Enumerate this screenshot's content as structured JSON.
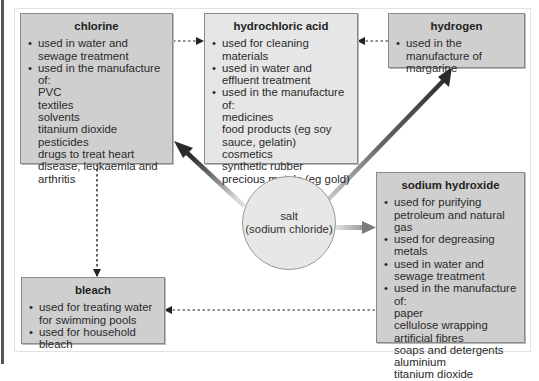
{
  "diagram": {
    "center": {
      "label": "salt",
      "sublabel": "(sodium chloride)"
    },
    "boxes": {
      "chlorine": {
        "title": "chlorine",
        "bullets": [
          {
            "text": "used in water and sewage treatment",
            "items": []
          },
          {
            "text": "used in the manufacture of:",
            "items": [
              "PVC",
              "textiles",
              "solvents",
              "titanium dioxide",
              "pesticides",
              "drugs to treat heart disease, leukaemia and arthritis"
            ]
          }
        ]
      },
      "hydrochloric_acid": {
        "title": "hydrochloric acid",
        "bullets": [
          {
            "text": "used for cleaning materials",
            "items": []
          },
          {
            "text": "used in water and effluent treatment",
            "items": []
          },
          {
            "text": "used in the manufacture of:",
            "items": [
              "medicines",
              "food products (eg soy sauce, gelatin)",
              "cosmetics",
              "synthetic rubber",
              "precious metals (eg gold)"
            ]
          }
        ]
      },
      "hydrogen": {
        "title": "hydrogen",
        "bullets": [
          {
            "text": "used in the manufacture of margarine",
            "items": []
          }
        ]
      },
      "sodium_hydroxide": {
        "title": "sodium hydroxide",
        "bullets": [
          {
            "text": "used for purifying petroleum and natural gas",
            "items": []
          },
          {
            "text": "used for degreasing metals",
            "items": []
          },
          {
            "text": "used in water and sewage treatment",
            "items": []
          },
          {
            "text": "used in the manufacture of:",
            "items": [
              "paper",
              "cellulose wrapping",
              "artificial fibres",
              "soaps and detergents",
              "aluminium",
              "titanium dioxide"
            ]
          }
        ]
      },
      "bleach": {
        "title": "bleach",
        "bullets": [
          {
            "text": "used for treating water for swimming pools",
            "items": []
          },
          {
            "text": "used for household bleach",
            "items": []
          }
        ]
      }
    },
    "links": [
      {
        "from": "salt",
        "to": "chlorine",
        "style": "solid-gradient"
      },
      {
        "from": "salt",
        "to": "hydrogen",
        "style": "solid-gradient"
      },
      {
        "from": "salt",
        "to": "sodium hydroxide",
        "style": "solid-gradient"
      },
      {
        "from": "chlorine",
        "to": "hydrochloric acid",
        "style": "dotted"
      },
      {
        "from": "hydrogen",
        "to": "hydrochloric acid",
        "style": "dotted"
      },
      {
        "from": "chlorine",
        "to": "bleach",
        "style": "dotted"
      },
      {
        "from": "sodium hydroxide",
        "to": "bleach",
        "style": "dotted"
      }
    ],
    "colors": {
      "box_dark": "#cfcfcf",
      "box_light": "#e6e6e6",
      "arrow_dark": "#3a3a3a",
      "arrow_light": "#d8d8d8"
    }
  }
}
